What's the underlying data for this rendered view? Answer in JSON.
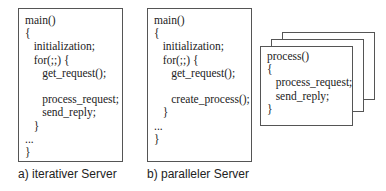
{
  "diagram": {
    "panel_a": {
      "caption": "a) iterativer Server",
      "code": "main()\n{\n   initialization;\n   for(;;) {\n      get_request();\n\n      process_request;\n      send_reply;\n   }\n...\n}"
    },
    "panel_b": {
      "caption": "b) paralleler Server",
      "code": "main()\n{\n   initialization;\n   for(;;) {\n      get_request();\n\n      create_process();\n   }\n...\n}"
    },
    "process_stack": {
      "code": "process()\n{\n   process_request;\n   send_reply;\n}",
      "stack_count": 3
    }
  }
}
